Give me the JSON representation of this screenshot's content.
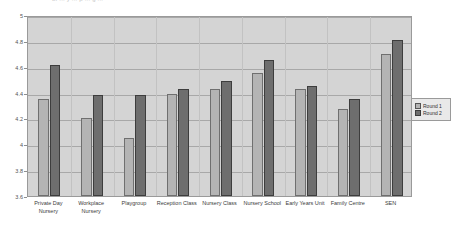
{
  "title_fragment": "of  ...  y   ...  p   ...  g   ...",
  "legend": {
    "position": "right",
    "items": [
      {
        "label": "Round 1",
        "color": "#b4b4b4"
      },
      {
        "label": "Round 2",
        "color": "#6e6e6e"
      }
    ]
  },
  "axis": {
    "y_ticks": [
      "5",
      "4.8",
      "4.6",
      "4.4",
      "4.2",
      "4",
      "3.8",
      "3.6"
    ]
  },
  "chart_data": {
    "type": "bar",
    "title": "",
    "xlabel": "",
    "ylabel": "",
    "ylim": [
      3.6,
      5.0
    ],
    "ytick_step": 0.2,
    "grid": true,
    "legend_position": "right",
    "categories": [
      "Private Day Nursery",
      "Workplace Nursery",
      "Playgroup",
      "Reception Class",
      "Nursery Class",
      "Nursery School",
      "Early Years Unit",
      "Family Centre",
      "SEN"
    ],
    "series": [
      {
        "name": "Round 1",
        "color": "#b4b4b4",
        "values": [
          4.35,
          4.2,
          4.05,
          4.39,
          4.43,
          4.55,
          4.43,
          4.27,
          4.7
        ]
      },
      {
        "name": "Round 2",
        "color": "#6e6e6e",
        "values": [
          4.61,
          4.38,
          4.38,
          4.43,
          4.49,
          4.65,
          4.45,
          4.35,
          4.81
        ]
      }
    ]
  }
}
